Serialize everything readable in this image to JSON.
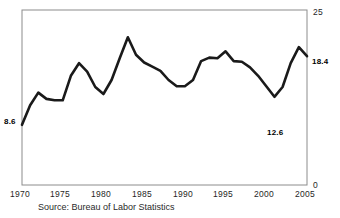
{
  "chart_data": {
    "type": "line",
    "title": "",
    "subtitle": "",
    "xlabel": "",
    "ylabel": "",
    "xlim": [
      1970,
      2005
    ],
    "ylim": [
      0,
      25
    ],
    "grid": false,
    "legend": false,
    "x_ticks": [
      "1970",
      "1975",
      "1980",
      "1985",
      "1990",
      "1995",
      "2000",
      "2005"
    ],
    "y_ticks": [
      "0",
      "25"
    ],
    "annotations": [
      {
        "label": "8.6",
        "x": 1970,
        "y": 8.6,
        "position": "left"
      },
      {
        "label": "12.6",
        "x": 2001,
        "y": 12.6,
        "position": "below"
      },
      {
        "label": "18.4",
        "x": 2005,
        "y": 18.4,
        "position": "right"
      }
    ],
    "series": [
      {
        "name": "Rate",
        "color": "#1a1a1a",
        "x": [
          1970,
          1971,
          1972,
          1973,
          1974,
          1975,
          1976,
          1977,
          1978,
          1979,
          1980,
          1981,
          1982,
          1983,
          1984,
          1985,
          1986,
          1987,
          1988,
          1989,
          1990,
          1991,
          1992,
          1993,
          1994,
          1995,
          1996,
          1997,
          1998,
          1999,
          2000,
          2001,
          2002,
          2003,
          2004,
          2005
        ],
        "values": [
          8.6,
          11.4,
          13.2,
          12.3,
          12.1,
          12.1,
          15.6,
          17.4,
          16.2,
          14.0,
          13.0,
          15.0,
          18.1,
          21.1,
          18.6,
          17.5,
          16.9,
          16.3,
          15.0,
          14.1,
          14.1,
          15.0,
          17.7,
          18.2,
          18.1,
          19.1,
          17.7,
          17.6,
          16.8,
          15.6,
          14.1,
          12.6,
          14.0,
          17.4,
          19.7,
          18.4
        ]
      }
    ],
    "source": "Source: Bureau of Labor Statistics"
  },
  "source_note": "Source: Bureau of Labor Statistics"
}
